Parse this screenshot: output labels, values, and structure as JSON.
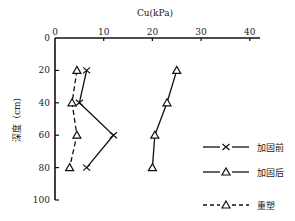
{
  "chart_data": {
    "type": "line",
    "title": "",
    "xlabel": "Cu(kPa)",
    "ylabel": "深度（cm)",
    "xlim": [
      0,
      40
    ],
    "ylim": [
      0,
      100
    ],
    "y_inverted": true,
    "x_axis_position": "top",
    "x_ticks": [
      "0",
      "10",
      "20",
      "30",
      "40"
    ],
    "y_ticks": [
      "0",
      "20",
      "40",
      "60",
      "80",
      "100"
    ],
    "grid": false,
    "legend_position": "right",
    "series": [
      {
        "name": "加固前",
        "marker": "x",
        "line": "solid",
        "depth": [
          20,
          40,
          60,
          80
        ],
        "cu": [
          6.5,
          5,
          12,
          6.5
        ]
      },
      {
        "name": "加固后",
        "marker": "triangle",
        "line": "solid",
        "depth": [
          20,
          40,
          60,
          80
        ],
        "cu": [
          25,
          23,
          20.5,
          20
        ]
      },
      {
        "name": "重塑",
        "marker": "triangle",
        "line": "dashed",
        "depth": [
          20,
          40,
          60,
          80
        ],
        "cu": [
          4.5,
          3.5,
          4.5,
          3
        ]
      }
    ]
  },
  "labels": {
    "xlabel": "Cu(kPa)",
    "ylabel": "深度（cm)",
    "legend": [
      "加固前",
      "加固后",
      "重塑"
    ]
  }
}
